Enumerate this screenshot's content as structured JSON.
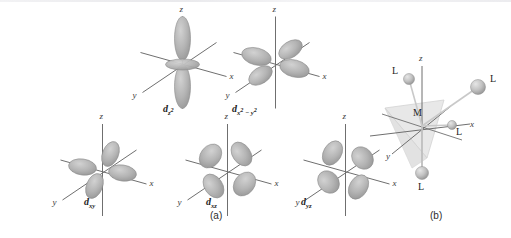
{
  "figure": {
    "background": "#ffffff",
    "panels": [
      {
        "id": "a",
        "label": "(a)",
        "caption_x": 210,
        "caption_y": 210
      },
      {
        "id": "b",
        "label": "(b)",
        "caption_x": 430,
        "caption_y": 210
      }
    ]
  },
  "axes": {
    "x": "x",
    "y": "y",
    "z": "z"
  },
  "colors": {
    "lobe_light": "#d2d2d2",
    "lobe_mid": "#b4b4b4",
    "lobe_dark": "#9a9a9a",
    "lobe_edge": "#8c8c8c",
    "axis_line": "#6f6f6f",
    "sphere_light": "#d8d8d8",
    "sphere_dark": "#9d9d9d",
    "tetra_fill": "#e4e4e4",
    "text": "#232323"
  },
  "orbitals": [
    {
      "id": "dz2",
      "name": "d-z-squared",
      "shape": "dz2",
      "label_main": "d",
      "label_sub": "z",
      "label_sup": "2",
      "x": 125,
      "y": 12,
      "w": 115,
      "h": 105,
      "label_x": 163,
      "label_y": 103,
      "axis_labels": {
        "x": "x",
        "y": "y",
        "z": "z"
      }
    },
    {
      "id": "dx2y2",
      "name": "d-x-squared-minus-y-squared",
      "shape": "dx2y2",
      "label_main": "d",
      "label_sub": "x",
      "label_sup": "2",
      "label_sub2": "y",
      "label_sup2": "2",
      "x": 218,
      "y": 12,
      "w": 115,
      "h": 105,
      "label_x": 232,
      "label_y": 103,
      "axis_labels": {
        "x": "x",
        "y": "y",
        "z": "z"
      }
    },
    {
      "id": "dxy",
      "name": "d-xy",
      "shape": "dxy",
      "label_main": "d",
      "label_sub": "xy",
      "x": 45,
      "y": 122,
      "w": 115,
      "h": 100,
      "label_x": 84,
      "label_y": 196,
      "axis_labels": {
        "x": "x",
        "y": "y",
        "z": "z"
      }
    },
    {
      "id": "dxz",
      "name": "d-xz",
      "shape": "dxz",
      "label_main": "d",
      "label_sub": "xz",
      "x": 170,
      "y": 122,
      "w": 115,
      "h": 100,
      "label_x": 206,
      "label_y": 196,
      "axis_labels": {
        "x": "x",
        "y": "y",
        "z": "z"
      }
    },
    {
      "id": "dyz",
      "name": "d-yz",
      "shape": "dyz",
      "label_main": "d",
      "label_sub": "yz",
      "x": 288,
      "y": 122,
      "w": 115,
      "h": 100,
      "label_x": 301,
      "label_y": 196,
      "axis_labels": {
        "x": "x",
        "y": "y",
        "z": "z"
      }
    }
  ],
  "complex": {
    "name": "tetrahedral-complex",
    "metal_label": "M",
    "ligand_label": "L",
    "ligand_count": 4,
    "geometry": "tetrahedral",
    "axis_labels": {
      "x": "x",
      "y": "y",
      "z": "z"
    },
    "ligands": [
      {
        "id": "L-upper-left",
        "label": "L",
        "cx": 409,
        "cy": 79,
        "r": 5.5,
        "text_x": 391,
        "text_y": 73
      },
      {
        "id": "L-upper-right",
        "label": "L",
        "cx": 478,
        "cy": 87,
        "r": 7.5,
        "text_x": 491,
        "text_y": 70
      },
      {
        "id": "L-front-right",
        "label": "L",
        "cx": 452,
        "cy": 125,
        "r": 4.5,
        "text_x": 455,
        "text_y": 127
      },
      {
        "id": "L-bottom",
        "label": "L",
        "cx": 422,
        "cy": 173,
        "r": 6.5,
        "text_x": 417,
        "text_y": 182
      }
    ]
  }
}
